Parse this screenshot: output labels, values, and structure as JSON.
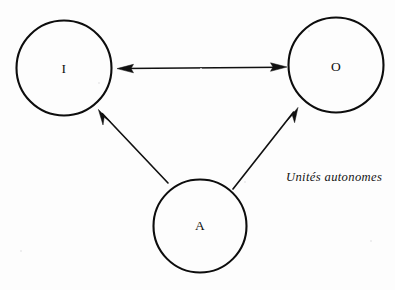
{
  "figure": {
    "type": "diagram",
    "kind": "node-link-diagram",
    "background_color": "#fdfdfd",
    "ink_color": "#111111",
    "width": 395,
    "height": 290,
    "caption": {
      "text": "Unités autonomes",
      "style": "italic",
      "x": 286,
      "y": 171
    },
    "nodes": [
      {
        "id": "I",
        "label": "I",
        "cx": 64,
        "cy": 68,
        "r": 47.5,
        "shape": "circle"
      },
      {
        "id": "O",
        "label": "O",
        "cx": 336,
        "cy": 65,
        "r": 47.5,
        "shape": "circle"
      },
      {
        "id": "A",
        "label": "A",
        "cx": 200,
        "cy": 226,
        "r": 46.5,
        "shape": "circle"
      }
    ],
    "edges": [
      {
        "id": "edge-i-o",
        "from": "I",
        "to": "O",
        "arrowheads": "both",
        "x1": 117,
        "y1": 68.5,
        "x2": 287,
        "y2": 67.0
      },
      {
        "id": "edge-a-i",
        "from": "A",
        "to": "I",
        "arrowheads": "end",
        "x1": 168,
        "y1": 183,
        "x2": 98.5,
        "y2": 109.5
      },
      {
        "id": "edge-a-o",
        "from": "A",
        "to": "O",
        "arrowheads": "end",
        "x1": 233,
        "y1": 189,
        "x2": 298,
        "y2": 107.5
      }
    ]
  }
}
